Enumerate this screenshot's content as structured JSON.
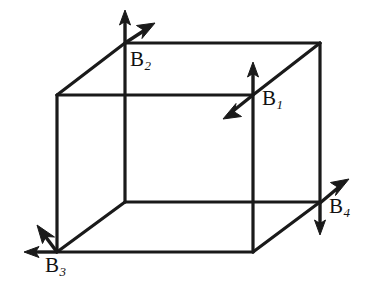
{
  "figure": {
    "type": "line-diagram",
    "background_color": "#ffffff",
    "line_color": "#1a1a1a",
    "canvas": {
      "width": 367,
      "height": 293
    }
  },
  "cube": {
    "front_face": {
      "top_left": [
        57,
        95
      ],
      "top_right": [
        253,
        95
      ],
      "bottom_right": [
        253,
        252
      ],
      "bottom_left": [
        57,
        252
      ]
    },
    "back_face": {
      "top_left": [
        125,
        43
      ],
      "top_right": [
        320,
        43
      ],
      "bottom_right": [
        320,
        202
      ],
      "bottom_left": [
        125,
        202
      ]
    },
    "edges": [
      "front-top",
      "front-right",
      "front-bottom",
      "front-left",
      "back-top",
      "back-right",
      "back-bottom",
      "back-left",
      "connector-top-left",
      "connector-top-right",
      "connector-bottom-left",
      "connector-bottom-right"
    ]
  },
  "vectors": [
    {
      "id": "B1",
      "label": "B",
      "subscript": "1",
      "origin": [
        253,
        95
      ],
      "arrows": [
        {
          "name": "b1-up-arrow",
          "direction": "up",
          "tip": [
            253,
            64
          ]
        },
        {
          "name": "b1-down-left-arrow",
          "direction": "down-left",
          "tip": [
            224,
            117
          ]
        }
      ],
      "label_position": [
        262,
        88
      ]
    },
    {
      "id": "B2",
      "label": "B",
      "subscript": "2",
      "origin": [
        125,
        43
      ],
      "arrows": [
        {
          "name": "b2-up-arrow",
          "direction": "up",
          "tip": [
            125,
            11
          ]
        },
        {
          "name": "b2-up-right-arrow",
          "direction": "up-right",
          "tip": [
            153,
            23
          ]
        }
      ],
      "label_position": [
        130,
        49
      ]
    },
    {
      "id": "B3",
      "label": "B",
      "subscript": "3",
      "origin": [
        57,
        252
      ],
      "arrows": [
        {
          "name": "b3-left-arrow",
          "direction": "left",
          "tip": [
            25,
            252
          ]
        },
        {
          "name": "b3-up-left-arrow",
          "direction": "up-left",
          "tip": [
            38,
            226
          ]
        }
      ],
      "label_position": [
        45,
        255
      ]
    },
    {
      "id": "B4",
      "label": "B",
      "subscript": "4",
      "origin": [
        320,
        203
      ],
      "arrows": [
        {
          "name": "b4-up-right-arrow",
          "direction": "up-right",
          "tip": [
            347,
            180
          ]
        },
        {
          "name": "b4-down-arrow",
          "direction": "down",
          "tip": [
            320,
            234
          ]
        }
      ],
      "label_position": [
        329,
        196
      ]
    }
  ]
}
